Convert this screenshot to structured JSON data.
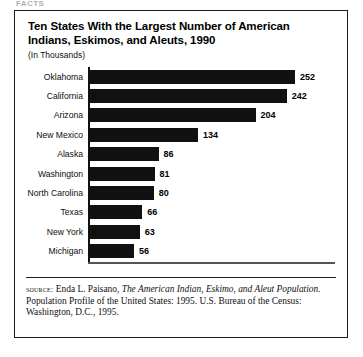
{
  "page": {
    "running_head": "FACTS"
  },
  "figure": {
    "title": "Ten States With the Largest Number of American Indians, Eskimos, and Aleuts, 1990",
    "subtitle": "(In Thousands)",
    "source": {
      "label": "source:",
      "author": "Enda L. Paisano,",
      "work_italic": "The American Indian, Eskimo, and Aleut Population.",
      "rest": "Population Profile of the United States: 1995. U.S. Bureau of the Census: Washington, D.C., 1995."
    }
  },
  "chart_data": {
    "type": "bar",
    "orientation": "horizontal",
    "title": "Ten States With the Largest Number of American Indians, Eskimos, and Aleuts, 1990",
    "subtitle": "(In Thousands)",
    "xlabel": "",
    "ylabel": "",
    "units": "thousands",
    "xlim": [
      0,
      300
    ],
    "grid": false,
    "legend": false,
    "bar_color": "#111111",
    "categories": [
      "Oklahoma",
      "California",
      "Arizona",
      "New Mexico",
      "Alaska",
      "Washington",
      "North Carolina",
      "Texas",
      "New York",
      "Michigan"
    ],
    "values": [
      252,
      242,
      204,
      134,
      86,
      81,
      80,
      66,
      63,
      56
    ],
    "bars": [
      {
        "category": "Oklahoma",
        "value": 252,
        "label": "252"
      },
      {
        "category": "California",
        "value": 242,
        "label": "242"
      },
      {
        "category": "Arizona",
        "value": 204,
        "label": "204"
      },
      {
        "category": "New Mexico",
        "value": 134,
        "label": "134"
      },
      {
        "category": "Alaska",
        "value": 86,
        "label": "86"
      },
      {
        "category": "Washington",
        "value": 81,
        "label": "81"
      },
      {
        "category": "North Carolina",
        "value": 80,
        "label": "80"
      },
      {
        "category": "Texas",
        "value": 66,
        "label": "66"
      },
      {
        "category": "New York",
        "value": 63,
        "label": "63"
      },
      {
        "category": "Michigan",
        "value": 56,
        "label": "56"
      }
    ]
  }
}
